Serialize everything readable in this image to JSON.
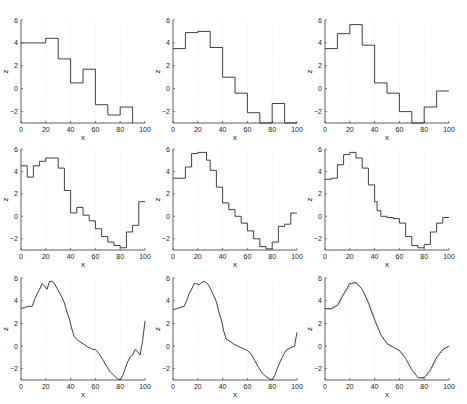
{
  "figure": {
    "layout": "3x3 grid",
    "panel_count": 9
  },
  "chart_data": [
    {
      "type": "line",
      "panel": 1,
      "style": "step",
      "xlabel": "x",
      "ylabel": "z",
      "xlim": [
        0,
        100
      ],
      "ylim": [
        -3,
        6
      ],
      "xticks": [
        0,
        20,
        40,
        60,
        80,
        100
      ],
      "yticks": [
        -2,
        0,
        2,
        4,
        6
      ],
      "grid": "vertical dotted at x=20,40,60,80",
      "x": [
        0,
        20,
        20,
        30,
        30,
        40,
        40,
        50,
        50,
        60,
        60,
        70,
        70,
        80,
        80,
        90,
        90
      ],
      "y": [
        4.0,
        4.0,
        4.4,
        4.4,
        2.6,
        2.6,
        0.5,
        0.5,
        1.7,
        1.7,
        -1.4,
        -1.4,
        -2.3,
        -2.3,
        -1.6,
        -1.6,
        -3.0
      ]
    },
    {
      "type": "line",
      "panel": 2,
      "style": "step",
      "xlabel": "x",
      "ylabel": "z",
      "xlim": [
        0,
        100
      ],
      "ylim": [
        -3,
        6
      ],
      "xticks": [
        0,
        20,
        40,
        60,
        80,
        100
      ],
      "yticks": [
        -2,
        0,
        2,
        4,
        6
      ],
      "x": [
        0,
        10,
        10,
        20,
        20,
        30,
        30,
        40,
        40,
        50,
        50,
        60,
        60,
        70,
        70,
        80,
        80,
        90,
        90,
        100
      ],
      "y": [
        3.5,
        3.5,
        4.9,
        4.9,
        5.0,
        5.0,
        3.6,
        3.6,
        1.0,
        1.0,
        -0.4,
        -0.4,
        -2.1,
        -2.1,
        -3.0,
        -3.0,
        -1.3,
        -1.3,
        -3.0,
        -3.0
      ]
    },
    {
      "type": "line",
      "panel": 3,
      "style": "step",
      "xlabel": "x",
      "ylabel": "z",
      "xlim": [
        0,
        100
      ],
      "ylim": [
        -3,
        6
      ],
      "xticks": [
        0,
        20,
        40,
        60,
        80,
        100
      ],
      "yticks": [
        -2,
        0,
        2,
        4,
        6
      ],
      "x": [
        0,
        10,
        10,
        20,
        20,
        30,
        30,
        40,
        40,
        50,
        50,
        60,
        60,
        70,
        70,
        80,
        80,
        90,
        90,
        100
      ],
      "y": [
        3.5,
        3.5,
        4.8,
        4.8,
        5.6,
        5.6,
        3.8,
        3.8,
        0.5,
        0.5,
        -0.4,
        -0.4,
        -2.0,
        -2.0,
        -3.0,
        -3.0,
        -1.6,
        -1.6,
        -0.2,
        -0.2
      ]
    },
    {
      "type": "line",
      "panel": 4,
      "style": "step",
      "xlabel": "x",
      "ylabel": "z",
      "xlim": [
        0,
        100
      ],
      "ylim": [
        -3,
        6
      ],
      "xticks": [
        0,
        20,
        40,
        60,
        80,
        100
      ],
      "yticks": [
        -2,
        0,
        2,
        4,
        6
      ],
      "x": [
        0,
        5,
        5,
        10,
        10,
        15,
        15,
        20,
        20,
        30,
        30,
        35,
        35,
        40,
        40,
        45,
        45,
        50,
        50,
        55,
        55,
        60,
        60,
        65,
        65,
        70,
        70,
        75,
        75,
        80,
        80,
        85,
        85,
        90,
        90,
        95,
        95,
        100
      ],
      "y": [
        4.5,
        4.5,
        3.5,
        3.5,
        4.5,
        4.5,
        4.9,
        4.9,
        5.2,
        5.2,
        4.3,
        4.3,
        2.3,
        2.3,
        0.3,
        0.3,
        0.8,
        0.8,
        0.1,
        0.1,
        -0.4,
        -0.4,
        -1.1,
        -1.1,
        -1.8,
        -1.8,
        -2.3,
        -2.3,
        -2.6,
        -2.6,
        -2.8,
        -2.8,
        -1.4,
        -1.4,
        -0.8,
        -0.8,
        1.3,
        1.3
      ]
    },
    {
      "type": "line",
      "panel": 5,
      "style": "step",
      "xlabel": "x",
      "ylabel": "z",
      "xlim": [
        0,
        100
      ],
      "ylim": [
        -3,
        6
      ],
      "xticks": [
        0,
        20,
        40,
        60,
        80,
        100
      ],
      "yticks": [
        -2,
        0,
        2,
        4,
        6
      ],
      "x": [
        0,
        10,
        10,
        15,
        15,
        20,
        20,
        25,
        25,
        27,
        27,
        30,
        30,
        35,
        35,
        37,
        37,
        40,
        40,
        45,
        45,
        50,
        50,
        55,
        55,
        60,
        60,
        65,
        65,
        70,
        70,
        75,
        75,
        80,
        80,
        85,
        85,
        90,
        90,
        95,
        95,
        100
      ],
      "y": [
        3.4,
        3.4,
        4.4,
        4.4,
        5.6,
        5.6,
        5.7,
        5.7,
        5.7,
        5.7,
        5.0,
        5.0,
        4.1,
        4.1,
        2.6,
        2.6,
        2.6,
        2.6,
        1.2,
        1.2,
        0.6,
        0.6,
        0.0,
        0.0,
        -0.6,
        -0.6,
        -1.3,
        -1.3,
        -2.0,
        -2.0,
        -2.7,
        -2.7,
        -2.9,
        -2.9,
        -2.3,
        -2.3,
        -0.9,
        -0.9,
        -0.7,
        -0.7,
        0.3,
        0.3
      ]
    },
    {
      "type": "line",
      "panel": 6,
      "style": "step",
      "xlabel": "x",
      "ylabel": "z",
      "xlim": [
        0,
        100
      ],
      "ylim": [
        -3,
        6
      ],
      "xticks": [
        0,
        20,
        40,
        60,
        80,
        100
      ],
      "yticks": [
        -2,
        0,
        2,
        4,
        6
      ],
      "x": [
        0,
        5,
        5,
        10,
        10,
        15,
        15,
        20,
        20,
        25,
        25,
        30,
        30,
        35,
        35,
        40,
        40,
        42,
        42,
        45,
        45,
        50,
        50,
        55,
        55,
        60,
        60,
        65,
        65,
        70,
        70,
        75,
        75,
        80,
        80,
        85,
        85,
        90,
        90,
        95,
        95,
        100
      ],
      "y": [
        3.3,
        3.3,
        3.4,
        3.4,
        4.6,
        4.6,
        5.5,
        5.5,
        5.7,
        5.7,
        5.2,
        5.2,
        4.3,
        4.3,
        2.8,
        2.8,
        1.3,
        1.3,
        0.5,
        0.5,
        0.0,
        0.0,
        -0.1,
        -0.1,
        -0.2,
        -0.2,
        -0.6,
        -0.6,
        -1.8,
        -1.8,
        -2.6,
        -2.6,
        -2.8,
        -2.8,
        -2.5,
        -2.5,
        -1.4,
        -1.4,
        -0.6,
        -0.6,
        -0.1,
        -0.1
      ]
    },
    {
      "type": "line",
      "panel": 7,
      "style": "step",
      "xlabel": "x",
      "ylabel": "z",
      "xlim": [
        0,
        100
      ],
      "ylim": [
        -3,
        6
      ],
      "xticks": [
        0,
        20,
        40,
        60,
        80,
        100
      ],
      "yticks": [
        -2,
        0,
        2,
        4,
        6
      ],
      "x": [
        0,
        3,
        6,
        9,
        11,
        13,
        15,
        17,
        19,
        21,
        23,
        25,
        27,
        29,
        31,
        33,
        35,
        37,
        39,
        41,
        43,
        46,
        50,
        54,
        58,
        60,
        63,
        66,
        69,
        72,
        75,
        78,
        80,
        82,
        84,
        86,
        88,
        90,
        92,
        94,
        96,
        98,
        100
      ],
      "y": [
        3.3,
        3.4,
        3.5,
        3.5,
        4.1,
        4.6,
        5.0,
        5.5,
        5.3,
        5.0,
        5.7,
        5.7,
        5.5,
        5.1,
        4.7,
        4.3,
        3.8,
        3.0,
        2.4,
        1.5,
        0.8,
        0.5,
        0.2,
        -0.1,
        -0.3,
        -0.3,
        -0.7,
        -1.2,
        -1.8,
        -2.3,
        -2.6,
        -2.9,
        -3.0,
        -2.6,
        -2.0,
        -1.4,
        -1.0,
        -0.8,
        -0.3,
        -0.5,
        -0.8,
        0.4,
        2.2
      ]
    },
    {
      "type": "line",
      "panel": 8,
      "style": "step",
      "xlabel": "x",
      "ylabel": "z",
      "xlim": [
        0,
        100
      ],
      "ylim": [
        -3,
        6
      ],
      "xticks": [
        0,
        20,
        40,
        60,
        80,
        100
      ],
      "yticks": [
        -2,
        0,
        2,
        4,
        6
      ],
      "x": [
        0,
        3,
        6,
        9,
        11,
        13,
        15,
        17,
        19,
        21,
        23,
        25,
        27,
        29,
        31,
        33,
        35,
        37,
        39,
        41,
        43,
        46,
        50,
        54,
        58,
        60,
        63,
        66,
        69,
        72,
        75,
        78,
        80,
        82,
        84,
        86,
        88,
        90,
        92,
        94,
        96,
        98,
        100
      ],
      "y": [
        3.2,
        3.3,
        3.4,
        3.5,
        4.0,
        4.6,
        5.0,
        5.5,
        5.5,
        5.4,
        5.6,
        5.7,
        5.6,
        5.3,
        4.9,
        4.4,
        3.9,
        3.0,
        2.3,
        1.3,
        0.6,
        0.4,
        0.1,
        -0.1,
        -0.3,
        -0.4,
        -0.7,
        -1.3,
        -1.9,
        -2.4,
        -2.7,
        -2.9,
        -3.0,
        -2.6,
        -2.0,
        -1.5,
        -1.0,
        -0.6,
        -0.3,
        -0.2,
        -0.1,
        0.0,
        1.2
      ]
    },
    {
      "type": "line",
      "panel": 9,
      "style": "smooth (solid + dotted overlay)",
      "xlabel": "x",
      "ylabel": "z",
      "xlim": [
        0,
        100
      ],
      "ylim": [
        -3,
        6
      ],
      "xticks": [
        0,
        20,
        40,
        60,
        80,
        100
      ],
      "yticks": [
        -2,
        0,
        2,
        4,
        6
      ],
      "x": [
        0,
        5,
        10,
        15,
        20,
        25,
        30,
        35,
        40,
        45,
        50,
        55,
        60,
        65,
        70,
        75,
        80,
        85,
        90,
        95,
        100
      ],
      "y": [
        3.3,
        3.3,
        3.6,
        4.6,
        5.5,
        5.6,
        5.0,
        3.8,
        2.3,
        1.0,
        0.2,
        -0.1,
        -0.4,
        -1.1,
        -2.1,
        -2.8,
        -2.8,
        -2.1,
        -1.0,
        -0.3,
        0.0
      ]
    }
  ]
}
